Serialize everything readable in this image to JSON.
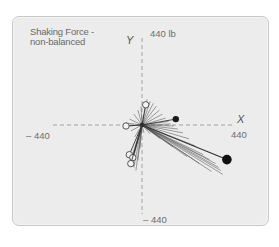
{
  "title": {
    "line1": "Shaking Force -",
    "line2": "non-balanced"
  },
  "axes": {
    "x_name": "X",
    "y_name": "Y",
    "x_pos_label": "440",
    "x_neg_label": "– 440",
    "y_pos_label": "440 lb",
    "y_neg_label": "– 440",
    "range": [
      -440,
      440
    ],
    "unit": "lb"
  },
  "chart_data": {
    "type": "scatter",
    "title": "Shaking Force - non-balanced",
    "xlabel": "X",
    "ylabel": "Y",
    "xlim": [
      -440,
      440
    ],
    "ylim": [
      -440,
      440
    ],
    "unit": "lb",
    "grid": false,
    "origin_axes": "dashed",
    "vectors": {
      "description": "Force vectors radiating from origin",
      "endpoints": [
        {
          "x": 25,
          "y": 129
        },
        {
          "x": 40,
          "y": 120
        },
        {
          "x": 55,
          "y": 110
        },
        {
          "x": 70,
          "y": 95
        },
        {
          "x": 85,
          "y": 75
        },
        {
          "x": 100,
          "y": 55
        },
        {
          "x": 115,
          "y": 35
        },
        {
          "x": 130,
          "y": 18
        },
        {
          "x": 140,
          "y": 5
        },
        {
          "x": 155,
          "y": -5
        },
        {
          "x": 175,
          "y": -20
        },
        {
          "x": 200,
          "y": -40
        },
        {
          "x": 230,
          "y": -70
        },
        {
          "x": 260,
          "y": -105
        },
        {
          "x": 300,
          "y": -150
        },
        {
          "x": 330,
          "y": -175
        },
        {
          "x": 360,
          "y": -195
        },
        {
          "x": 375,
          "y": -215
        },
        {
          "x": 385,
          "y": -230
        },
        {
          "x": 395,
          "y": -250
        },
        {
          "x": 340,
          "y": -235
        },
        {
          "x": 280,
          "y": -195
        },
        {
          "x": 220,
          "y": -160
        },
        {
          "x": 150,
          "y": -110
        },
        {
          "x": 90,
          "y": -70
        },
        {
          "x": 40,
          "y": -45
        },
        {
          "x": 10,
          "y": -40
        },
        {
          "x": -25,
          "y": -95
        },
        {
          "x": -40,
          "y": -140
        },
        {
          "x": -55,
          "y": -175
        },
        {
          "x": -50,
          "y": -200
        },
        {
          "x": -40,
          "y": -215
        },
        {
          "x": -30,
          "y": -230
        },
        {
          "x": -20,
          "y": -180
        },
        {
          "x": -10,
          "y": -120
        },
        {
          "x": -35,
          "y": -60
        },
        {
          "x": -55,
          "y": -30
        },
        {
          "x": -75,
          "y": -5
        },
        {
          "x": -80,
          "y": 10
        },
        {
          "x": -60,
          "y": 30
        },
        {
          "x": -40,
          "y": 55
        },
        {
          "x": -20,
          "y": 75
        },
        {
          "x": -5,
          "y": 95
        }
      ]
    },
    "markers": [
      {
        "type": "open-circle",
        "x": 18,
        "y": 102
      },
      {
        "type": "open-circle",
        "x": -78,
        "y": -5
      },
      {
        "type": "open-circle",
        "x": -62,
        "y": -150
      },
      {
        "type": "open-circle",
        "x": -45,
        "y": -165
      },
      {
        "type": "open-circle",
        "x": -55,
        "y": -195
      },
      {
        "type": "filled-small",
        "x": 165,
        "y": 30
      },
      {
        "type": "filled-large",
        "x": 415,
        "y": -175
      }
    ]
  }
}
